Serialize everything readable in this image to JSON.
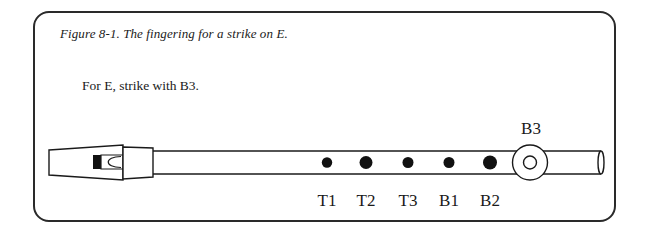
{
  "figure": {
    "caption": "Figure 8-1. The fingering for a strike on E.",
    "instruction": "For E, strike with B3."
  },
  "holes": [
    {
      "label": "T1",
      "state": "closed",
      "x": 327
    },
    {
      "label": "T2",
      "state": "closed",
      "x": 366
    },
    {
      "label": "T3",
      "state": "closed",
      "x": 408
    },
    {
      "label": "B1",
      "state": "closed",
      "x": 449
    },
    {
      "label": "B2",
      "state": "closed",
      "x": 490
    },
    {
      "label": "B3",
      "state": "strike",
      "x": 530
    }
  ],
  "labels": {
    "t1": "T1",
    "t2": "T2",
    "t3": "T3",
    "b1": "B1",
    "b2": "B2",
    "b3": "B3"
  },
  "colors": {
    "ink": "#1a1a1a",
    "background": "#ffffff"
  }
}
